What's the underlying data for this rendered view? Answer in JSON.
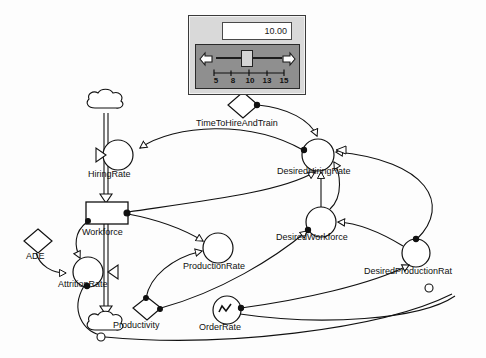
{
  "diagram": {
    "type": "stock-and-flow",
    "slider_panel": {
      "value": "10.00",
      "min_tick": "5",
      "max_tick": "15",
      "tick_labels": [
        "5",
        "8",
        "10",
        "13",
        "15"
      ],
      "left_arrow_icon": "arrow-left-icon",
      "right_arrow_icon": "arrow-right-icon",
      "thumb_icon": "slider-thumb"
    },
    "nodes": {
      "time_to_hire": {
        "label": "TimeToHireAndTrain",
        "shape": "diamond"
      },
      "hiring_rate": {
        "label": "HiringRate",
        "shape": "flow-valve"
      },
      "desired_hiring_rate": {
        "label": "DesiredHiringRate",
        "shape": "circle"
      },
      "workforce": {
        "label": "Workforce",
        "shape": "stock-rectangle"
      },
      "ade": {
        "label": "ADE",
        "shape": "diamond"
      },
      "attrition_rate": {
        "label": "AttritionRate",
        "shape": "flow-valve"
      },
      "production_rate": {
        "label": "ProductionRate",
        "shape": "circle"
      },
      "desired_workforce": {
        "label": "DesiredWorkforce",
        "shape": "circle"
      },
      "desired_production_rate": {
        "label": "DesiredProductionRat",
        "shape": "circle"
      },
      "productivity": {
        "label": "Productivity",
        "shape": "diamond"
      },
      "order_rate": {
        "label": "OrderRate",
        "shape": "circle-graph"
      }
    },
    "colors": {
      "stroke": "#111111",
      "panel_face": "#d9d9d9",
      "slider_face": "#8f8f8f",
      "value_box": "#ffffff",
      "canvas": "#fdfdfd"
    }
  }
}
